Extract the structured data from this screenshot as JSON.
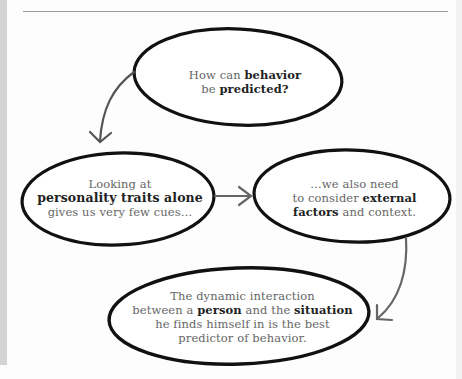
{
  "diagram": {
    "type": "flowchart",
    "nodes": [
      {
        "id": "question",
        "lines": [
          [
            {
              "text": "How can ",
              "bold": false
            },
            {
              "text": "behavior",
              "bold": true
            }
          ],
          [
            {
              "text": "be ",
              "bold": false
            },
            {
              "text": "predicted?",
              "bold": true
            }
          ]
        ]
      },
      {
        "id": "traits",
        "lines": [
          [
            {
              "text": "Looking at",
              "bold": false
            }
          ],
          [
            {
              "text": "personality traits alone",
              "bold": true
            }
          ],
          [
            {
              "text": "gives us very few cues…",
              "bold": false
            }
          ]
        ]
      },
      {
        "id": "external",
        "lines": [
          [
            {
              "text": "…we also need",
              "bold": false
            }
          ],
          [
            {
              "text": "to consider ",
              "bold": false
            },
            {
              "text": "external",
              "bold": true
            }
          ],
          [
            {
              "text": "factors",
              "bold": true
            },
            {
              "text": " and context.",
              "bold": false
            }
          ]
        ]
      },
      {
        "id": "conclusion",
        "lines": [
          [
            {
              "text": "The dynamic interaction",
              "bold": false
            }
          ],
          [
            {
              "text": "between a ",
              "bold": false
            },
            {
              "text": "person",
              "bold": true
            },
            {
              "text": " and the ",
              "bold": false
            },
            {
              "text": "situation",
              "bold": true
            }
          ],
          [
            {
              "text": "he finds himself in is the best",
              "bold": false
            }
          ],
          [
            {
              "text": "predictor of behavior.",
              "bold": false
            }
          ]
        ]
      }
    ],
    "edges": [
      {
        "from": "question",
        "to": "traits"
      },
      {
        "from": "traits",
        "to": "external"
      },
      {
        "from": "external",
        "to": "conclusion"
      }
    ],
    "colors": {
      "ellipse_stroke": "#111111",
      "arrow_stroke": "#555555",
      "text_regular": "#666666",
      "text_bold": "#222222",
      "page_bg": "#fdfdfd",
      "left_stripe": "#d4d4d4",
      "rule": "#9a9a9a"
    }
  }
}
